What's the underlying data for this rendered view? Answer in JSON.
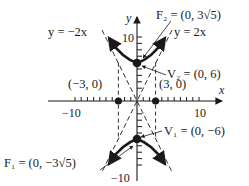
{
  "diagram": {
    "type": "hyperbola",
    "equation_orientation": "vertical transverse axis",
    "axes": {
      "x_label": "x",
      "y_label": "y",
      "x_ticks": {
        "neg": "−10",
        "pos": "10"
      },
      "y_ticks": {
        "pos": "10",
        "neg": "−10"
      }
    },
    "labels": {
      "asym_neg": "y = −2x",
      "asym_pos": "y = 2x",
      "f2": "F₂ = (0, 3√5)",
      "v2": "V₂ = (0, 6)",
      "v1": "V₁ = (0, −6)",
      "f1": "F₁ = (0, −3√5)",
      "pt_left": "(−3, 0)",
      "pt_right": "(3, 0)"
    },
    "vertices": [
      [
        0,
        6
      ],
      [
        0,
        -6
      ]
    ],
    "foci": [
      [
        0,
        6.708
      ],
      [
        0,
        -6.708
      ]
    ],
    "asymptotes": [
      "y = 2x",
      "y = -2x"
    ],
    "box_points": [
      [
        -3,
        0
      ],
      [
        3,
        0
      ]
    ],
    "colors": {
      "ink": "#1a1a1a",
      "background": "#ffffff"
    }
  }
}
